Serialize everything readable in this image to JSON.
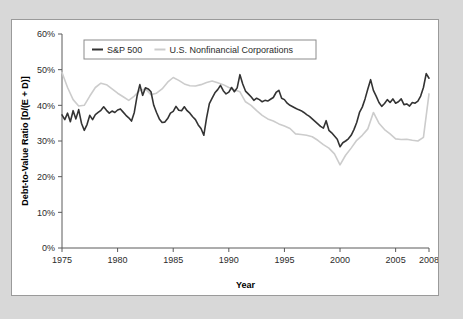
{
  "figure": {
    "background_color": "#d8d8d8",
    "panel_color": "#ffffff",
    "panel_border_color": "#9a9a9a"
  },
  "chart_data": {
    "type": "line",
    "title": "",
    "xlabel": "Year",
    "ylabel": "Debt-to-Value Ratio [D/(E + D)]",
    "xlim": [
      1975,
      2008
    ],
    "ylim": [
      0,
      60
    ],
    "grid": false,
    "legend_position": "top-left-inside",
    "xticks": [
      1975,
      1980,
      1985,
      1990,
      1995,
      2000,
      2005,
      2008
    ],
    "xtick_labels": [
      "1975",
      "1980",
      "1985",
      "1990",
      "1995",
      "2000",
      "2005",
      "2008"
    ],
    "yticks": [
      0,
      10,
      20,
      30,
      40,
      50,
      60
    ],
    "ytick_labels": [
      "0%",
      "10%",
      "20%",
      "30%",
      "40%",
      "50%",
      "60%"
    ],
    "series": [
      {
        "name": "S&P 500",
        "color": "#333333",
        "width": 1.6,
        "x": [
          1975.0,
          1975.25,
          1975.5,
          1975.75,
          1976.0,
          1976.25,
          1976.5,
          1976.75,
          1977.0,
          1977.25,
          1977.5,
          1977.75,
          1978.0,
          1978.25,
          1978.5,
          1978.75,
          1979.0,
          1979.25,
          1979.5,
          1979.75,
          1980.0,
          1980.25,
          1980.5,
          1980.75,
          1981.0,
          1981.25,
          1981.5,
          1981.75,
          1982.0,
          1982.25,
          1982.5,
          1982.75,
          1983.0,
          1983.25,
          1983.5,
          1983.75,
          1984.0,
          1984.25,
          1984.5,
          1984.75,
          1985.0,
          1985.25,
          1985.5,
          1985.75,
          1986.0,
          1986.25,
          1986.5,
          1986.75,
          1987.0,
          1987.25,
          1987.5,
          1987.75,
          1988.0,
          1988.25,
          1988.5,
          1988.75,
          1989.0,
          1989.25,
          1989.5,
          1989.75,
          1990.0,
          1990.25,
          1990.5,
          1990.75,
          1991.0,
          1991.25,
          1991.5,
          1991.75,
          1992.0,
          1992.25,
          1992.5,
          1992.75,
          1993.0,
          1993.25,
          1993.5,
          1993.75,
          1994.0,
          1994.25,
          1994.5,
          1994.75,
          1995.0,
          1995.25,
          1995.5,
          1995.75,
          1996.0,
          1996.25,
          1996.5,
          1996.75,
          1997.0,
          1997.25,
          1997.5,
          1997.75,
          1998.0,
          1998.25,
          1998.5,
          1998.75,
          1999.0,
          1999.25,
          1999.5,
          1999.75,
          2000.0,
          2000.25,
          2000.5,
          2000.75,
          2001.0,
          2001.25,
          2001.5,
          2001.75,
          2002.0,
          2002.25,
          2002.5,
          2002.75,
          2003.0,
          2003.25,
          2003.5,
          2003.75,
          2004.0,
          2004.25,
          2004.5,
          2004.75,
          2005.0,
          2005.25,
          2005.5,
          2005.75,
          2006.0,
          2006.25,
          2006.5,
          2006.75,
          2007.0,
          2007.25,
          2007.5,
          2007.75,
          2008.0
        ],
        "y": [
          37.3,
          36.0,
          37.8,
          35.4,
          38.5,
          36.2,
          38.8,
          35.0,
          33.0,
          34.6,
          37.2,
          36.0,
          37.4,
          38.0,
          38.6,
          39.6,
          38.6,
          37.8,
          38.4,
          38.0,
          38.7,
          39.0,
          38.1,
          37.2,
          36.5,
          35.6,
          38.0,
          42.6,
          45.8,
          42.8,
          44.9,
          44.6,
          43.8,
          40.0,
          38.0,
          36.2,
          35.2,
          35.3,
          36.3,
          37.8,
          38.3,
          39.7,
          38.6,
          38.5,
          39.6,
          38.5,
          37.8,
          36.8,
          36.0,
          34.5,
          33.5,
          31.6,
          36.5,
          40.5,
          42.0,
          43.5,
          44.4,
          45.6,
          44.1,
          43.2,
          43.7,
          45.0,
          43.8,
          44.9,
          48.6,
          46.0,
          44.0,
          43.2,
          42.4,
          41.4,
          42.0,
          41.6,
          41.0,
          41.4,
          41.2,
          41.7,
          42.2,
          43.6,
          44.2,
          42.0,
          41.6,
          40.6,
          40.0,
          39.6,
          39.2,
          38.8,
          38.5,
          38.0,
          37.4,
          36.9,
          36.2,
          35.5,
          34.8,
          34.1,
          33.6,
          35.7,
          33.0,
          32.3,
          31.4,
          30.5,
          28.4,
          29.5,
          30.0,
          30.6,
          31.6,
          33.2,
          35.2,
          38.0,
          39.5,
          41.8,
          44.6,
          47.2,
          44.2,
          42.6,
          40.8,
          39.7,
          40.5,
          41.6,
          40.8,
          41.8,
          40.6,
          41.0,
          41.8,
          40.2,
          40.4,
          39.8,
          40.8,
          40.6,
          41.2,
          42.6,
          45.0,
          48.9,
          47.6
        ]
      },
      {
        "name": "U.S. Nonfinancial Corporations",
        "color": "#cccccc",
        "width": 1.6,
        "x": [
          1975.0,
          1975.5,
          1976.0,
          1976.5,
          1977.0,
          1977.5,
          1978.0,
          1978.5,
          1979.0,
          1979.5,
          1980.0,
          1980.5,
          1981.0,
          1981.5,
          1982.0,
          1982.5,
          1983.0,
          1983.5,
          1984.0,
          1984.5,
          1985.0,
          1985.5,
          1986.0,
          1986.5,
          1987.0,
          1987.5,
          1988.0,
          1988.5,
          1989.0,
          1989.5,
          1990.0,
          1990.5,
          1991.0,
          1991.5,
          1992.0,
          1992.5,
          1993.0,
          1993.5,
          1994.0,
          1994.5,
          1995.0,
          1995.5,
          1996.0,
          1996.5,
          1997.0,
          1997.5,
          1998.0,
          1998.5,
          1999.0,
          1999.5,
          2000.0,
          2000.5,
          2001.0,
          2001.5,
          2002.0,
          2002.5,
          2003.0,
          2003.5,
          2004.0,
          2004.5,
          2005.0,
          2005.5,
          2006.0,
          2006.5,
          2007.0,
          2007.5,
          2008.0
        ],
        "y": [
          49.2,
          45.0,
          41.6,
          39.8,
          40.0,
          42.6,
          45.0,
          46.2,
          45.8,
          44.6,
          43.4,
          42.4,
          41.4,
          42.6,
          44.2,
          44.6,
          43.0,
          43.4,
          44.6,
          46.5,
          47.8,
          47.0,
          46.0,
          45.5,
          45.4,
          45.8,
          46.4,
          46.8,
          46.3,
          45.8,
          45.0,
          44.4,
          43.8,
          41.0,
          40.0,
          38.5,
          37.2,
          36.2,
          35.6,
          34.8,
          34.2,
          33.5,
          32.0,
          31.8,
          31.6,
          31.2,
          30.2,
          29.0,
          28.0,
          26.4,
          23.3,
          26.0,
          28.0,
          30.2,
          31.6,
          33.4,
          38.0,
          35.0,
          33.2,
          32.0,
          30.6,
          30.4,
          30.5,
          30.2,
          30.0,
          31.0,
          43.2
        ]
      }
    ]
  },
  "legend": {
    "items": [
      {
        "label": "S&P 500",
        "color": "#333333"
      },
      {
        "label": "U.S. Nonfinancial Corporations",
        "color": "#cccccc"
      }
    ]
  }
}
